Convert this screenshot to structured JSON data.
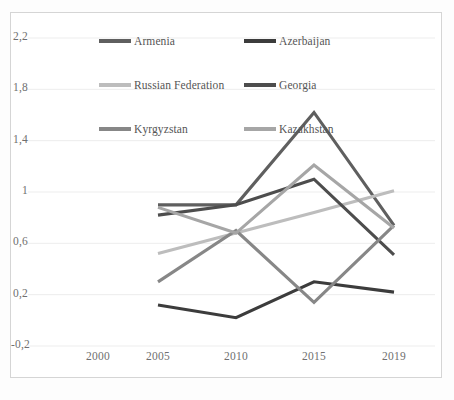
{
  "chart_data": {
    "type": "line",
    "title": "",
    "subtitle": "",
    "xlabel": "",
    "ylabel": "",
    "x": [
      2000,
      2005,
      2010,
      2015,
      2019
    ],
    "categories": [
      "2000",
      "2005",
      "2010",
      "2015",
      "2019"
    ],
    "xtick_labels": [
      "2000",
      "2005",
      "2010",
      "2015",
      "2019"
    ],
    "ytick_labels": [
      "2,2",
      "1,8",
      "1,4",
      "1",
      "0,6",
      "0,2",
      "-0,2"
    ],
    "ytick_values": [
      2.2,
      1.8,
      1.4,
      1.0,
      0.6,
      0.2,
      -0.2
    ],
    "ylim": [
      -0.2,
      2.2
    ],
    "xlim": [
      2000,
      2019
    ],
    "grid": "horizontal",
    "legend_position": "top-inside",
    "decimal_separator": ",",
    "series": [
      {
        "name": "Armenia",
        "color": "#5f5f5f",
        "x": [
          2005,
          2010,
          2015,
          2019
        ],
        "values": [
          0.9,
          0.9,
          1.62,
          0.74
        ]
      },
      {
        "name": "Azerbaijan",
        "color": "#3c3c3c",
        "x": [
          2005,
          2010,
          2015,
          2019
        ],
        "values": [
          0.12,
          0.02,
          0.3,
          0.22
        ]
      },
      {
        "name": "Russian Federation",
        "color": "#bdbdbd",
        "x": [
          2005,
          2010,
          2015,
          2019
        ],
        "values": [
          0.52,
          0.68,
          0.84,
          1.01
        ]
      },
      {
        "name": "Georgia",
        "color": "#4d4d4d",
        "x": [
          2005,
          2010,
          2015,
          2019
        ],
        "values": [
          0.82,
          0.9,
          1.1,
          0.51
        ]
      },
      {
        "name": "Kyrgyzstan",
        "color": "#878787",
        "x": [
          2005,
          2010,
          2015,
          2019
        ],
        "values": [
          0.3,
          0.7,
          0.14,
          0.74
        ]
      },
      {
        "name": "Kazakhstan",
        "color": "#a6a6a6",
        "x": [
          2005,
          2010,
          2015,
          2019
        ],
        "values": [
          0.88,
          0.68,
          1.21,
          0.72
        ]
      }
    ]
  },
  "legend": {
    "items": [
      {
        "label": "Armenia",
        "color": "#5f5f5f"
      },
      {
        "label": "Azerbaijan",
        "color": "#3c3c3c"
      },
      {
        "label": "Russian Federation",
        "color": "#bdbdbd"
      },
      {
        "label": "Georgia",
        "color": "#4d4d4d"
      },
      {
        "label": "Kyrgyzstan",
        "color": "#878787"
      },
      {
        "label": "Kazakhstan",
        "color": "#a6a6a6"
      }
    ]
  },
  "style": {
    "plot_background": "#ffffff",
    "frame_border": "#d5d5d5",
    "gridline_color": "#ededed",
    "tick_label_color": "#6f6f6f",
    "legend_text_color": "#555555"
  }
}
